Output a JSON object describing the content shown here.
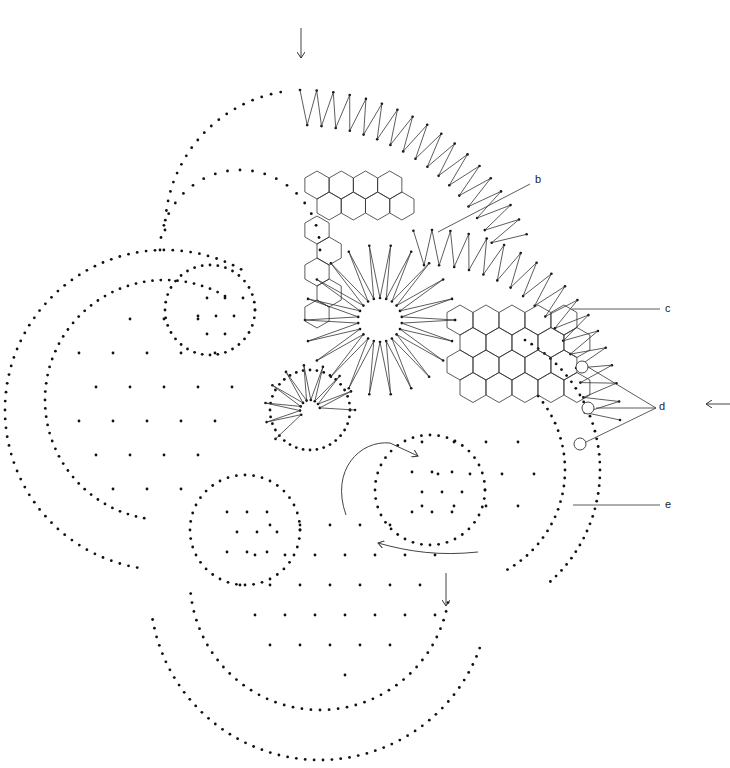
{
  "diagram": {
    "type": "bobbin lace pricking with working diagram",
    "background": "#ffffff",
    "ink": "#111111",
    "line_color": "#333333",
    "labels": [
      {
        "id": "b",
        "text": "b",
        "x": 535,
        "y": 180,
        "leader_from": [
          530,
          184
        ],
        "leader_to": [
          438,
          232
        ]
      },
      {
        "id": "c",
        "text": "c",
        "x": 665,
        "y": 309,
        "leader_from": [
          660,
          309
        ],
        "leader_to": [
          572,
          309
        ]
      },
      {
        "id": "d",
        "text": "d",
        "x": 659,
        "y": 407
      },
      {
        "id": "e",
        "text": "e",
        "x": 665,
        "y": 505,
        "leader_from": [
          660,
          505
        ],
        "leader_to": [
          573,
          505
        ]
      }
    ],
    "d_leaders": [
      {
        "from": [
          656,
          408
        ],
        "to": [
          588,
          367
        ]
      },
      {
        "from": [
          656,
          408
        ],
        "to": [
          596,
          408
        ]
      },
      {
        "from": [
          656,
          408
        ],
        "to": [
          584,
          443
        ]
      }
    ],
    "pin_circles": [
      {
        "cx": 582,
        "cy": 367,
        "r": 6
      },
      {
        "cx": 588,
        "cy": 408,
        "r": 6
      },
      {
        "cx": 580,
        "cy": 444,
        "r": 6
      }
    ],
    "direction_arrows": [
      {
        "name": "start-arrow-top",
        "from": [
          301,
          28
        ],
        "to": [
          301,
          58
        ]
      },
      {
        "name": "work-direction-right",
        "from": [
          730,
          404
        ],
        "to": [
          706,
          404
        ]
      },
      {
        "name": "curve-arrow-clockwise",
        "path": "M346,515 C330,470 360,440 390,443 L418,456"
      },
      {
        "name": "curve-arrow-back",
        "path": "M478,552 C440,556 410,552 378,543"
      },
      {
        "name": "down-arrow-bottom",
        "from": [
          446,
          573
        ],
        "to": [
          446,
          606
        ]
      }
    ]
  }
}
